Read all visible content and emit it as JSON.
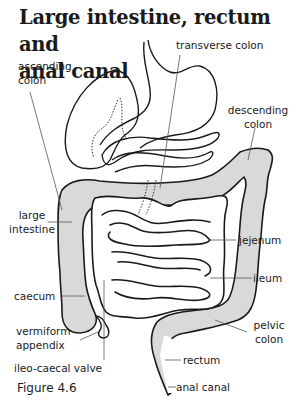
{
  "title": {
    "line1": "Large intestine, rectum and",
    "line2": "anal canal"
  },
  "labels": {
    "transverse_colon": "transverse colon",
    "ascending_colon_1": "ascending",
    "ascending_colon_2": "colon",
    "descending_colon_1": "descending",
    "descending_colon_2": "colon",
    "large_intestine_1": "large",
    "large_intestine_2": "intestine",
    "jejenum": "jejenum",
    "ileum": "ileum",
    "caecum": "caecum",
    "pelvic_colon_1": "pelvic",
    "pelvic_colon_2": "colon",
    "vermiform_appendix_1": "vermiform",
    "vermiform_appendix_2": "appendix",
    "rectum": "rectum",
    "ileo_caecal_valve": "ileo-caecal valve",
    "anal_canal": "anal canal"
  },
  "caption": "Figure 4.6",
  "colors": {
    "background": "#ffffff",
    "outline": "#1a1a1a",
    "large_intestine_fill": "#d9d9d9",
    "leader_line": "#555555"
  }
}
